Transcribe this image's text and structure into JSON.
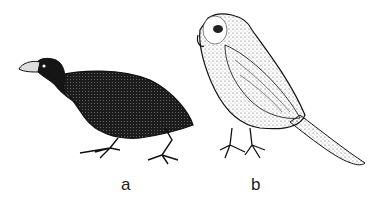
{
  "figure": {
    "panels": [
      {
        "label": "a",
        "subject": "dark stocky ground bird with stout hooked beak, walking"
      },
      {
        "label": "b",
        "subject": "pale speckled owl-like parrot with long tail, perched standing"
      }
    ],
    "colors": {
      "background": "#ffffff",
      "ink": "#1a1a1a"
    }
  }
}
